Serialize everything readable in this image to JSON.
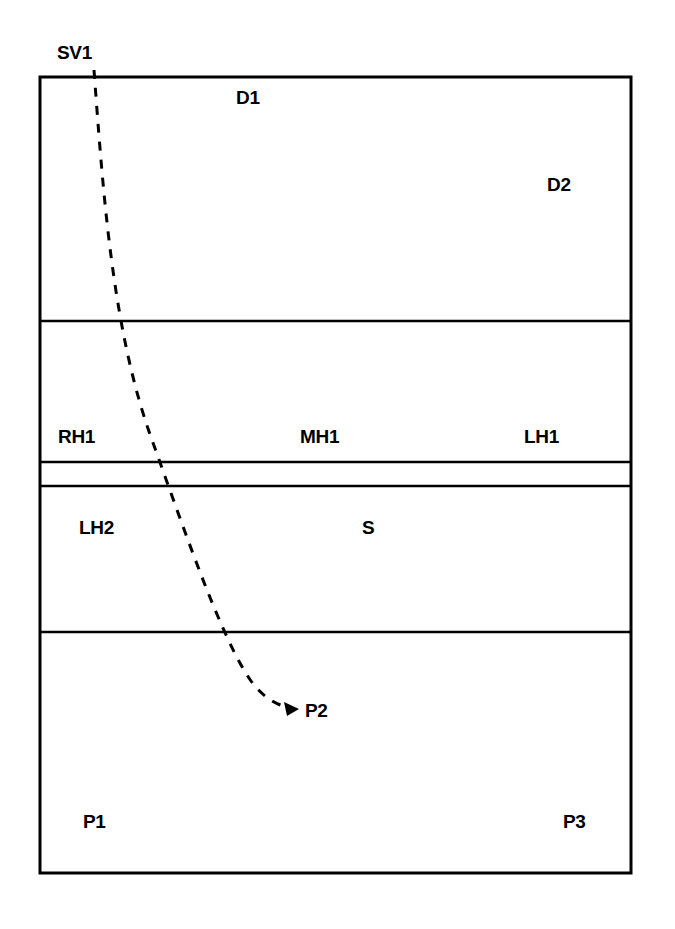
{
  "diagram": {
    "kind": "volleyball-court-serve-diagram",
    "stroke_color": "#000000",
    "background_color": "#ffffff",
    "court": {
      "left": 40,
      "top": 77,
      "right": 631,
      "bottom": 873,
      "border_width": 3
    },
    "divider_lines": [
      {
        "name": "back-zone-line",
        "y": 321
      },
      {
        "name": "attack-line-far",
        "y": 462
      },
      {
        "name": "center-line",
        "y": 486
      },
      {
        "name": "attack-line-near",
        "y": 632
      }
    ],
    "serve_path": {
      "name": "serve-trajectory",
      "style": "dashed",
      "dash_pattern": "9 9",
      "stroke_width": 3,
      "start": {
        "x": 94,
        "y": 70
      },
      "end": {
        "x": 293,
        "y": 707
      },
      "control_points": [
        {
          "x": 112,
          "y": 260
        },
        {
          "x": 196,
          "y": 560
        },
        {
          "x": 251,
          "y": 690
        }
      ],
      "arrowhead": {
        "x": 296,
        "y": 709,
        "size": 11
      }
    },
    "labels": [
      {
        "name": "label-sv1",
        "text": "SV1",
        "x": 57,
        "y": 43
      },
      {
        "name": "label-d1",
        "text": "D1",
        "x": 236,
        "y": 88
      },
      {
        "name": "label-d2",
        "text": "D2",
        "x": 547,
        "y": 175
      },
      {
        "name": "label-rh1",
        "text": "RH1",
        "x": 58,
        "y": 427
      },
      {
        "name": "label-mh1",
        "text": "MH1",
        "x": 300,
        "y": 427
      },
      {
        "name": "label-lh1",
        "text": "LH1",
        "x": 524,
        "y": 427
      },
      {
        "name": "label-lh2",
        "text": "LH2",
        "x": 79,
        "y": 518
      },
      {
        "name": "label-s",
        "text": "S",
        "x": 362,
        "y": 518
      },
      {
        "name": "label-p2",
        "text": "P2",
        "x": 305,
        "y": 701
      },
      {
        "name": "label-p1",
        "text": "P1",
        "x": 83,
        "y": 812
      },
      {
        "name": "label-p3",
        "text": "P3",
        "x": 563,
        "y": 812
      }
    ]
  }
}
